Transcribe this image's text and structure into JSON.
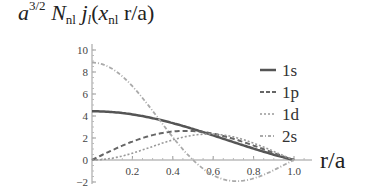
{
  "title": {
    "a": "a",
    "exp": "3/2",
    "N": "N",
    "N_sub": "nl",
    "j": "j",
    "j_sub": "l",
    "open": "(",
    "x": "x",
    "x_sub": "nl",
    "rest": " r/a)"
  },
  "chart_data": {
    "type": "line",
    "xlabel": "r/a",
    "ylabel": "a^{3/2} N_nl j_l(x_nl r/a)",
    "xlim": [
      0,
      1.0
    ],
    "ylim": [
      -2,
      10
    ],
    "xticks": [
      "0.2",
      "0.4",
      "0.6",
      "0.8",
      "1.0"
    ],
    "yticks": [
      "-2",
      "0",
      "2",
      "4",
      "6",
      "8",
      "10"
    ],
    "grid": false,
    "legend_position": "upper right",
    "x": [
      0,
      0.1,
      0.2,
      0.3,
      0.4,
      0.5,
      0.6,
      0.7,
      0.8,
      0.9,
      1.0
    ],
    "series": [
      {
        "name": "1s",
        "style": "solid",
        "values": [
          4.43,
          4.37,
          4.19,
          3.91,
          3.54,
          3.09,
          2.57,
          2.0,
          1.37,
          0.7,
          0.0
        ]
      },
      {
        "name": "1p",
        "style": "dashed",
        "values": [
          0.0,
          0.75,
          1.43,
          2.0,
          2.41,
          2.63,
          2.66,
          2.5,
          2.14,
          1.2,
          0.0
        ]
      },
      {
        "name": "1d",
        "style": "dotted",
        "values": [
          0.0,
          0.12,
          0.45,
          0.95,
          1.52,
          2.04,
          2.42,
          2.58,
          2.43,
          1.6,
          0.0
        ]
      },
      {
        "name": "2s",
        "style": "dash-dot",
        "values": [
          8.86,
          8.45,
          7.26,
          5.5,
          3.45,
          1.4,
          -0.35,
          -1.5,
          -1.85,
          -1.3,
          0.0
        ]
      }
    ]
  },
  "legend": [
    {
      "label": "1s"
    },
    {
      "label": "1p"
    },
    {
      "label": "1d"
    },
    {
      "label": "2s"
    }
  ],
  "axis": {
    "xticks": [
      "0.2",
      "0.4",
      "0.6",
      "0.8",
      "1.0"
    ],
    "yticks": [
      "10",
      "8",
      "6",
      "4",
      "2",
      "0",
      "−2"
    ],
    "xlabel": "r/a"
  }
}
